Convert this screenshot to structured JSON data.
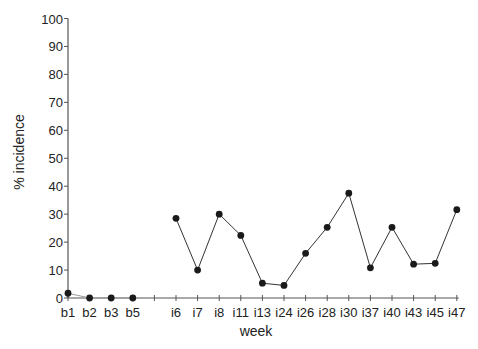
{
  "chart_data": {
    "type": "line",
    "title": "",
    "xlabel": "week",
    "ylabel": "% incidence",
    "ylim": [
      0,
      100
    ],
    "yticks": [
      0,
      10,
      20,
      30,
      40,
      50,
      60,
      70,
      80,
      90,
      100
    ],
    "grid": false,
    "legend": null,
    "categories": [
      "b1",
      "b2",
      "b3",
      "b5",
      "",
      "i6",
      "i7",
      "i8",
      "i11",
      "i13",
      "i24",
      "i26",
      "i28",
      "i30",
      "i37",
      "i40",
      "i43",
      "i45",
      "i47"
    ],
    "series": [
      {
        "name": "baseline",
        "x": [
          "b1",
          "b2",
          "b3",
          "b5"
        ],
        "values": [
          1.7,
          0,
          0,
          0
        ]
      },
      {
        "name": "infection",
        "x": [
          "i6",
          "i7",
          "i8",
          "i11",
          "i13",
          "i24",
          "i26",
          "i28",
          "i30",
          "i37",
          "i40",
          "i43",
          "i45",
          "i47"
        ],
        "values": [
          28.5,
          10,
          30,
          22.4,
          5.3,
          4.5,
          16,
          25.3,
          37.5,
          10.8,
          25.3,
          12.1,
          12.4,
          31.6
        ]
      }
    ]
  },
  "style": {
    "line_color": "#333333",
    "marker_color": "#1a1a1a",
    "axis_color": "#555555"
  }
}
